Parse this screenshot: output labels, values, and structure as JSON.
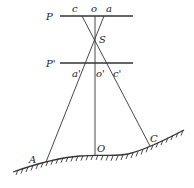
{
  "diagram": {
    "title": "",
    "labels": {
      "P": "P",
      "c": "c",
      "o": "o",
      "a": "a",
      "S": "S",
      "P_prime": "P'",
      "a_prime": "a'",
      "o_prime": "o'",
      "c_prime": "c'",
      "A": "A",
      "O": "O",
      "C": "C"
    },
    "elements": [
      {
        "id": "plane-P",
        "type": "line",
        "label": "P"
      },
      {
        "id": "plane-P-prime",
        "type": "line",
        "label": "P'"
      },
      {
        "id": "perspective-center",
        "type": "point",
        "label": "S"
      },
      {
        "id": "ray-A-c",
        "type": "line",
        "from": "A",
        "through": "S",
        "to": "c"
      },
      {
        "id": "ray-O-o",
        "type": "line",
        "from": "O",
        "through": "S",
        "to": "o"
      },
      {
        "id": "ray-C-a",
        "type": "line",
        "from": "C",
        "through": "S",
        "to": "a"
      },
      {
        "id": "ground-surface",
        "type": "hatched-curve",
        "points": [
          "A",
          "O",
          "C"
        ]
      }
    ]
  }
}
